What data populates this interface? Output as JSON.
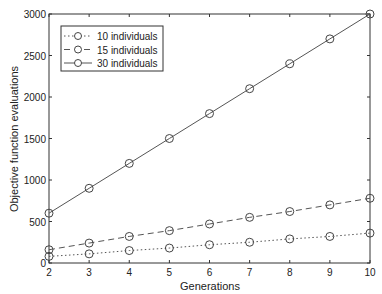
{
  "chart_data": {
    "type": "line",
    "title": "",
    "xlabel": "Generations",
    "ylabel": "Objective function evaluations",
    "x": [
      2,
      3,
      4,
      5,
      6,
      7,
      8,
      9,
      10
    ],
    "xlim": [
      2,
      10
    ],
    "ylim": [
      0,
      3000
    ],
    "xticks": [
      "2",
      "3",
      "4",
      "5",
      "6",
      "7",
      "8",
      "9",
      "10"
    ],
    "yticks": [
      "0",
      "500",
      "1000",
      "1500",
      "2000",
      "2500",
      "3000"
    ],
    "grid": false,
    "legend_position": "upper left",
    "series": [
      {
        "name": "10 individuals",
        "style": "dotted",
        "marker": "circle",
        "values": [
          80,
          110,
          150,
          180,
          220,
          250,
          290,
          320,
          360
        ]
      },
      {
        "name": "15 individuals",
        "style": "dashed",
        "marker": "circle",
        "values": [
          160,
          240,
          320,
          390,
          470,
          550,
          620,
          700,
          780
        ]
      },
      {
        "name": "30 individuals",
        "style": "solid",
        "marker": "circle",
        "values": [
          600,
          900,
          1200,
          1500,
          1800,
          2100,
          2400,
          2700,
          3000
        ]
      }
    ]
  }
}
